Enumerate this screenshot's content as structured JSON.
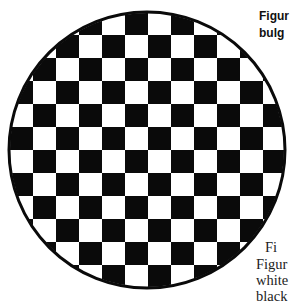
{
  "figure": {
    "colors": {
      "dark": "#0a0a0a",
      "light": "#ffffff"
    }
  },
  "caption": {
    "line1": "Figur",
    "line2": "bulg"
  },
  "body_text": {
    "line1": "Fi",
    "line2": "Figur",
    "line3": "white",
    "line4": "black"
  }
}
